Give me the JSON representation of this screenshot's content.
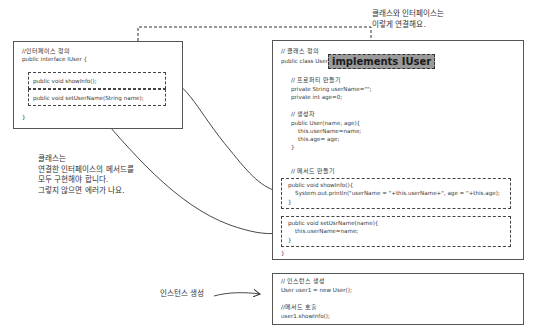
{
  "annotations": {
    "top": [
      "클래스와 인터페이스는",
      "이렇게 연결해요."
    ],
    "left": [
      "클래스는",
      "연결한 인터페이스의 메서드를",
      "모두 구현해야 합니다.",
      "그렇지 않으면 에러가 나요."
    ],
    "instance": "인스턴스 생성"
  },
  "interface_box": {
    "comment": "//인터페이스 정의",
    "declaration": "public interface IUser {",
    "methods": [
      "public void showInfo();",
      "public void setUserName(String name);"
    ],
    "closing": "}"
  },
  "class_box": {
    "comment": "// 클래스 정의",
    "declaration_prefix": "public class User",
    "implements": "implements IUser",
    "declaration_suffix": "{",
    "property_comment": "// 프로퍼티 만들기",
    "properties": [
      "private String userName=\"\";",
      "private int age=0;"
    ],
    "constructor_comment": "// 생성자",
    "constructor": [
      "public User(name, age){",
      "    this.userName=name;",
      "    this.age= age;",
      "}"
    ],
    "method_comment": "// 메서드 만들기",
    "show_info": [
      "public void showInfo(){",
      "    System.out.println(\"userName = \"+this.userName+\", age = \"+this.age);",
      "}"
    ],
    "set_user_name": [
      "public void setUsrName(name){",
      "    this.userName=name;",
      "}"
    ],
    "closing": "}"
  },
  "usage_box": {
    "instance_comment": "// 인스턴스 생성",
    "instance_code": "User user1 = new User();",
    "call_comment": "//메서드 호출",
    "call_code": "user1.showInfo();"
  }
}
